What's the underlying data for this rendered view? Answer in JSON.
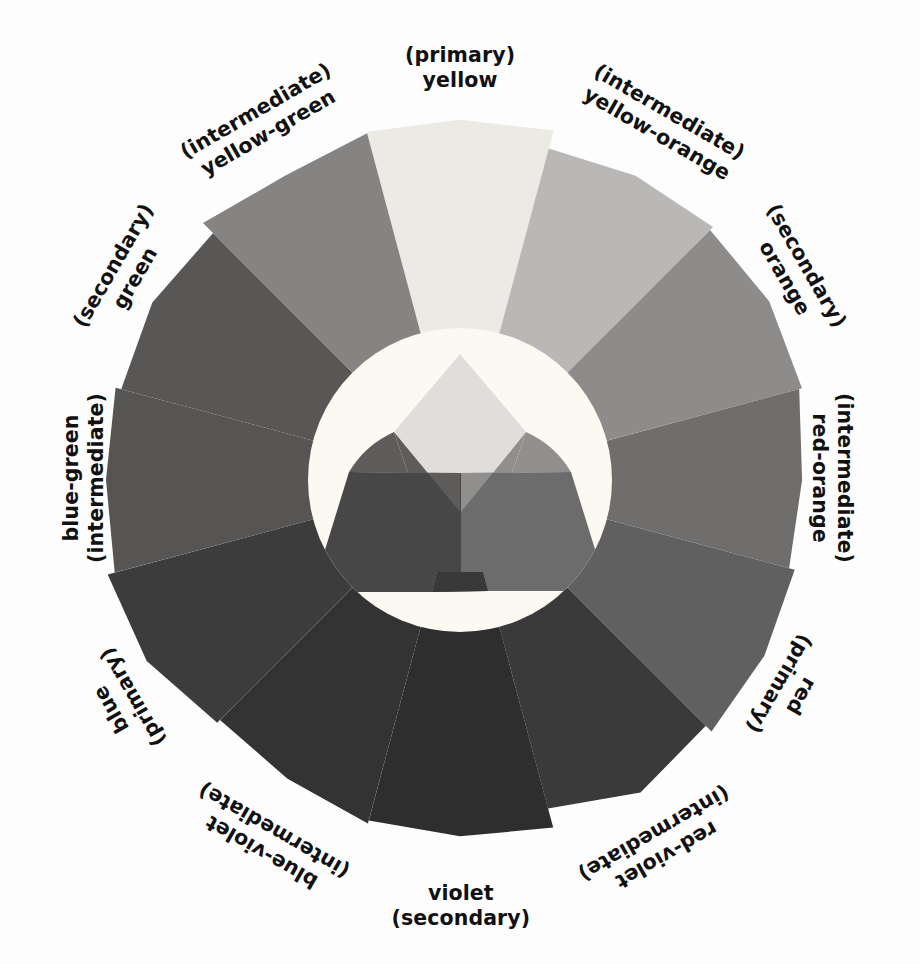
{
  "figure": {
    "name": "color-wheel",
    "background_color": "#fdfdfd",
    "center_circle_color": "#fbfaf4"
  },
  "wheel": {
    "center_x": 460,
    "center_y": 480,
    "inner_radius": 152,
    "outer_radius": 352,
    "segment_count": 12,
    "segments": [
      {
        "id": "yellow",
        "color_name": "yellow",
        "category": "primary",
        "label_line1": "(primary)",
        "label_line2": "yellow",
        "swatch_color": "#eceae4",
        "angle_deg": 270,
        "label_x": 460,
        "label_y": 68,
        "label_rotate": 0
      },
      {
        "id": "yellow-orange",
        "color_name": "yellow-orange",
        "category": "intermediate",
        "label_line1": "(intermediate)",
        "label_line2": "yellow-orange",
        "swatch_color": "#b9b8b6",
        "angle_deg": 300,
        "label_x": 663,
        "label_y": 123,
        "label_rotate": 30
      },
      {
        "id": "orange",
        "color_name": "orange",
        "category": "secondary",
        "label_line1": "(secondary)",
        "label_line2": "orange",
        "swatch_color": "#8d8c8a",
        "angle_deg": 330,
        "label_x": 795,
        "label_y": 272,
        "label_rotate": 60
      },
      {
        "id": "red-orange",
        "color_name": "red-orange",
        "category": "intermediate",
        "label_line1": "(intermediate)",
        "label_line2": "red-orange",
        "swatch_color": "#6f6e6c",
        "angle_deg": 0,
        "label_x": 832,
        "label_y": 478,
        "label_rotate": 90
      },
      {
        "id": "red",
        "color_name": "red",
        "category": "primary",
        "label_line1": "red",
        "label_line2": "(primary)",
        "swatch_color": "#616060",
        "angle_deg": 30,
        "label_x": 790,
        "label_y": 690,
        "label_rotate": 120
      },
      {
        "id": "red-violet",
        "color_name": "red-violet",
        "category": "intermediate",
        "label_line1": "red-violet",
        "label_line2": "(intermediate)",
        "swatch_color": "#3b3a3a",
        "angle_deg": 60,
        "label_x": 660,
        "label_y": 844,
        "label_rotate": 150
      },
      {
        "id": "violet",
        "color_name": "violet",
        "category": "secondary",
        "label_line1": "violet",
        "label_line2": "(secondary)",
        "swatch_color": "#2f2e2e",
        "angle_deg": 90,
        "label_x": 461,
        "label_y": 906,
        "label_rotate": 0
      },
      {
        "id": "blue-violet",
        "color_name": "blue-violet",
        "category": "intermediate",
        "label_line1": "blue-violet",
        "label_line2": "(intermediate)",
        "swatch_color": "#343333",
        "angle_deg": 120,
        "label_x": 268,
        "label_y": 841,
        "label_rotate": -150
      },
      {
        "id": "blue",
        "color_name": "blue",
        "category": "primary",
        "label_line1": "blue",
        "label_line2": "(primary)",
        "swatch_color": "#3d3c3c",
        "angle_deg": 150,
        "label_x": 122,
        "label_y": 703,
        "label_rotate": -120
      },
      {
        "id": "blue-green",
        "color_name": "blue-green",
        "category": "intermediate",
        "label_line1": "blue-green",
        "label_line2": "(intermediate)",
        "swatch_color": "#565554",
        "angle_deg": 180,
        "label_x": 84,
        "label_y": 478,
        "label_rotate": -90
      },
      {
        "id": "green",
        "color_name": "green",
        "category": "secondary",
        "label_line1": "(secondary)",
        "label_line2": "green",
        "swatch_color": "#585756",
        "angle_deg": 210,
        "label_x": 124,
        "label_y": 272,
        "label_rotate": -60
      },
      {
        "id": "yellow-green",
        "color_name": "yellow-green",
        "category": "intermediate",
        "label_line1": "(intermediate)",
        "label_line2": "yellow-green",
        "swatch_color": "#858482",
        "angle_deg": 240,
        "label_x": 262,
        "label_y": 122,
        "label_rotate": -30
      }
    ]
  },
  "center_diagram": {
    "name": "primary-color-mixing-triangle",
    "circle_fill": "#fbf9f2",
    "shapes": [
      {
        "id": "yellow-diamond",
        "color_name": "yellow",
        "fill": "#dfdedb"
      },
      {
        "id": "blue-quad",
        "color_name": "blue",
        "fill": "#484747"
      },
      {
        "id": "red-quad",
        "color_name": "red",
        "fill": "#6d6c6c"
      },
      {
        "id": "green-overlap",
        "color_name": "green",
        "fill": "#5e5d5c"
      },
      {
        "id": "orange-overlap",
        "color_name": "orange",
        "fill": "#908f8d"
      },
      {
        "id": "violet-overlap",
        "color_name": "violet",
        "fill": "#3a3939"
      }
    ]
  }
}
